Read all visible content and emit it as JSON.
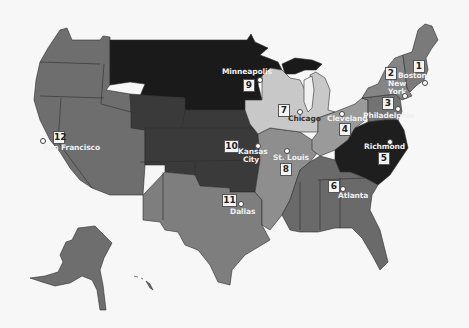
{
  "map": {
    "title": "Federal Reserve Districts",
    "colors": {
      "background": "#f7f7f7",
      "d1": "#7a7a7a",
      "d2": "#858585",
      "d3": "#737373",
      "d4": "#9a9a9a",
      "d5": "#1e1e1e",
      "d6": "#6a6a6a",
      "d7": "#c8c8c8",
      "d8": "#8e8e8e",
      "d9": "#1a1a1a",
      "d10": "#3a3a3a",
      "d11": "#7e7e7e",
      "d12": "#6e6e6e",
      "lake_michigan": "#f2f2f2"
    },
    "districts": [
      {
        "number": "1",
        "city": "Boston"
      },
      {
        "number": "2",
        "city": "New York"
      },
      {
        "number": "3",
        "city": "Philadelphia"
      },
      {
        "number": "4",
        "city": "Cleveland"
      },
      {
        "number": "5",
        "city": "Richmond"
      },
      {
        "number": "6",
        "city": "Atlanta"
      },
      {
        "number": "7",
        "city": "Chicago"
      },
      {
        "number": "8",
        "city": "St. Louis"
      },
      {
        "number": "9",
        "city": "Minneapolis"
      },
      {
        "number": "10",
        "city": "Kansas City"
      },
      {
        "number": "11",
        "city": "Dallas"
      },
      {
        "number": "12",
        "city": "San Francisco"
      }
    ],
    "labels": {
      "boston": "Boston",
      "new_york_1": "New",
      "new_york_2": "York",
      "philadelphia": "Philadelphia",
      "cleveland": "Cleveland",
      "richmond": "Richmond",
      "atlanta": "Atlanta",
      "chicago": "Chicago",
      "st_louis": "St. Louis",
      "minneapolis": "Minneapolis",
      "kansas_city_1": "Kansas",
      "kansas_city_2": "City",
      "dallas": "Dallas",
      "san_francisco": "San Francisco"
    }
  }
}
